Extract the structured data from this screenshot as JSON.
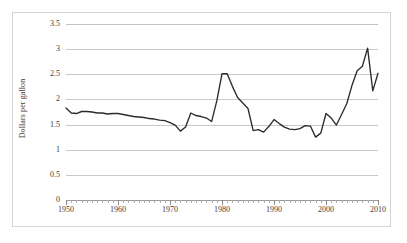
{
  "chart_data": {
    "type": "line",
    "title": "",
    "subtitle": "",
    "xlabel": "",
    "ylabel": "Dollars per gallon",
    "xlim": [
      1950,
      2010
    ],
    "ylim": [
      0,
      3.5
    ],
    "grid": true,
    "legend": false,
    "legend_position": "none",
    "y_ticks": [
      "0",
      "0.5",
      "1",
      "1.5",
      "2",
      "2.5",
      "3",
      "3.5"
    ],
    "y_tick_values": [
      0,
      0.5,
      1,
      1.5,
      2,
      2.5,
      3,
      3.5
    ],
    "x_ticks": [
      "1950",
      "1960",
      "1970",
      "1980",
      "1990",
      "2000",
      "2010"
    ],
    "x_tick_values": [
      1950,
      1960,
      1970,
      1980,
      1990,
      2000,
      2010
    ],
    "x_minor_tick_interval": 1,
    "series_color": "#2b2b2b",
    "grid_color": "#c9c9c9",
    "x": [
      1950,
      1951,
      1952,
      1953,
      1954,
      1955,
      1956,
      1957,
      1958,
      1959,
      1960,
      1961,
      1962,
      1963,
      1964,
      1965,
      1966,
      1967,
      1968,
      1969,
      1970,
      1971,
      1972,
      1973,
      1974,
      1975,
      1976,
      1977,
      1978,
      1979,
      1980,
      1981,
      1982,
      1983,
      1984,
      1985,
      1986,
      1987,
      1988,
      1989,
      1990,
      1991,
      1992,
      1993,
      1994,
      1995,
      1996,
      1997,
      1998,
      1999,
      2000,
      2001,
      2002,
      2003,
      2004,
      2005,
      2006,
      2007,
      2008,
      2009,
      2010
    ],
    "values": [
      1.83,
      1.73,
      1.72,
      1.76,
      1.76,
      1.75,
      1.73,
      1.73,
      1.71,
      1.72,
      1.72,
      1.7,
      1.68,
      1.66,
      1.65,
      1.64,
      1.62,
      1.61,
      1.59,
      1.58,
      1.54,
      1.49,
      1.37,
      1.45,
      1.73,
      1.68,
      1.66,
      1.63,
      1.56,
      1.97,
      2.51,
      2.51,
      2.26,
      2.04,
      1.93,
      1.82,
      1.38,
      1.4,
      1.35,
      1.46,
      1.6,
      1.52,
      1.45,
      1.41,
      1.4,
      1.42,
      1.48,
      1.47,
      1.25,
      1.33,
      1.72,
      1.63,
      1.49,
      1.7,
      1.92,
      2.28,
      2.57,
      2.66,
      3.02,
      2.17,
      2.52
    ]
  },
  "chart": {
    "y_axis_title": "Dollars per gallon"
  }
}
